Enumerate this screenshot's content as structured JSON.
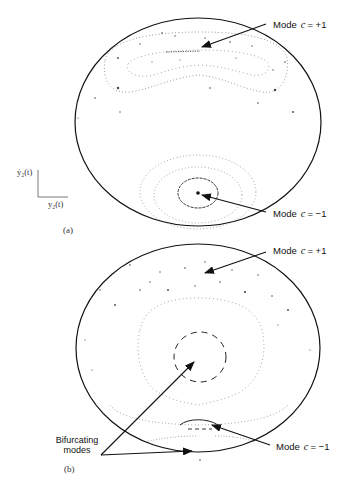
{
  "figure": {
    "panel_a": {
      "tag": "(a)",
      "mode_plus": {
        "prefix": "Mode",
        "var": "c",
        "value": "= +1"
      },
      "mode_minus": {
        "prefix": "Mode",
        "var": "c",
        "value": "= −1"
      },
      "axis": {
        "y_label": "ẏ₂(t)",
        "x_label": "y₂(t)"
      }
    },
    "panel_b": {
      "tag": "(b)",
      "mode_plus": {
        "prefix": "Mode",
        "var": "c",
        "value": "= +1"
      },
      "mode_minus": {
        "prefix": "Mode",
        "var": "c",
        "value": "= −1"
      },
      "bifurcating": {
        "line1": "Bifurcating",
        "line2": "modes"
      }
    },
    "colors": {
      "ink": "#111111",
      "dots": "#555555",
      "background": "#ffffff"
    }
  }
}
